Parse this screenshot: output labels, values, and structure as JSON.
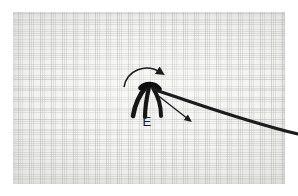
{
  "image": {
    "kind": "macro-photograph",
    "subject": "embroidery stitch on woven fabric",
    "width": 298,
    "height": 196,
    "background_color": "#ffffff"
  },
  "fabric": {
    "name": "woven-fabric-swatch",
    "base_color": "#f2f2f1",
    "weave_color": "#a4a4a2",
    "left": 13,
    "top": 12,
    "width": 272,
    "height": 172
  },
  "annotations": {
    "stitch_label": "E",
    "label_color": "#1b1b1b",
    "ink_color": "#141414",
    "guide_line": {
      "name": "vertical-guide-line",
      "color": "#6e6e6e",
      "x": 149,
      "y_top": 14,
      "y_bottom": 181
    },
    "curved_arrow": {
      "name": "curved-loop-arrow",
      "direction": "clockwise-over-top",
      "color": "#1a1a1a"
    },
    "straight_arrow": {
      "name": "thread-direction-arrow",
      "direction": "down-right",
      "color": "#1a1a1a"
    }
  },
  "threads": {
    "stitch_strands": [
      {
        "name": "stitch-strand-left",
        "color": "#141414"
      },
      {
        "name": "stitch-strand-center",
        "color": "#171717"
      },
      {
        "name": "stitch-strand-right",
        "color": "#151515"
      }
    ],
    "working_thread": {
      "name": "working-thread",
      "color": "#1c1c1c",
      "from": "stitch-top",
      "to": "right-edge"
    }
  }
}
